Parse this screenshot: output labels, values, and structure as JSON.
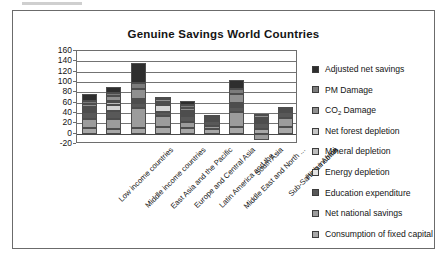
{
  "chart_data": {
    "type": "bar",
    "subtype": "stacked-bar",
    "title": "Genuine Savings World Countries",
    "xlabel": "",
    "ylabel": "",
    "ylim": [
      -20,
      160
    ],
    "yticks": [
      160,
      140,
      120,
      100,
      80,
      60,
      40,
      20,
      0,
      -20
    ],
    "ytick_labels": [
      "160",
      "140",
      "120",
      "100",
      "80",
      "60",
      "40",
      "20",
      "0",
      "-20"
    ],
    "grid": "horizontal",
    "legend_position": "right",
    "categories": [
      "Low income countries",
      "Middle income countries",
      "East Asia and the Pacific",
      "Europe and Central Asia",
      "Latin America and the ...",
      "Middle East and North ...",
      "South Asia",
      "Sub-Saharan Africa",
      "High income"
    ],
    "series": [
      {
        "name": "Consumption of fixed capital",
        "color": "#a8a8a8",
        "values": [
          11,
          9,
          11,
          12,
          11,
          9,
          12,
          9,
          13
        ]
      },
      {
        "name": "Net national savings",
        "color": "#9c9c9c",
        "values": [
          18,
          20,
          39,
          22,
          12,
          5,
          30,
          -13,
          18
        ]
      },
      {
        "name": "Education expenditure",
        "color": "#585858",
        "values": [
          12,
          15,
          9,
          8,
          11,
          11,
          9,
          11,
          11
        ]
      },
      {
        "name": "Energy depletion",
        "color": "#d4d4d4",
        "values": [
          3,
          12,
          3,
          14,
          4,
          2,
          3,
          4,
          2
        ]
      },
      {
        "name": "Mineral depletion",
        "color": "#bcbcbc",
        "values": [
          3,
          5,
          3,
          3,
          3,
          2,
          2,
          3,
          1
        ]
      },
      {
        "name": "Net forest depletion",
        "color": "#c4c4c4",
        "values": [
          4,
          2,
          2,
          2,
          3,
          1,
          3,
          4,
          1
        ]
      },
      {
        "name": "CO2 Damage",
        "color": "#909090",
        "values": [
          7,
          10,
          19,
          6,
          6,
          4,
          17,
          5,
          4
        ]
      },
      {
        "name": "PM Damage",
        "color": "#7c7c7c",
        "values": [
          5,
          6,
          12,
          4,
          5,
          2,
          11,
          3,
          2
        ]
      },
      {
        "name": "Adjusted net savings",
        "color": "#2e2e2e",
        "values": [
          13,
          12,
          39,
          0,
          9,
          0,
          16,
          0,
          0
        ]
      }
    ],
    "bar_totals": [
      76,
      91,
      137,
      71,
      64,
      36,
      103,
      26,
      52
    ],
    "legend_entries": [
      {
        "label": "Adjusted net savings",
        "color": "#2e2e2e"
      },
      {
        "label": "PM Damage",
        "color": "#7c7c7c"
      },
      {
        "label": "CO2 Damage",
        "label_html": "CO<sub>2</sub> Damage",
        "color": "#909090"
      },
      {
        "label": "Net forest depletion",
        "color": "#c4c4c4"
      },
      {
        "label": "Mineral depletion",
        "color": "#bcbcbc"
      },
      {
        "label": "Energy depletion",
        "color": "#e2e2e2"
      },
      {
        "label": "Education expenditure",
        "color": "#585858"
      },
      {
        "label": "Net national savings",
        "color": "#9c9c9c"
      },
      {
        "label": "Consumption of fixed capital",
        "color": "#a8a8a8"
      }
    ]
  },
  "frame": {
    "border_color": "#6b6b6b",
    "background": "#ffffff"
  }
}
